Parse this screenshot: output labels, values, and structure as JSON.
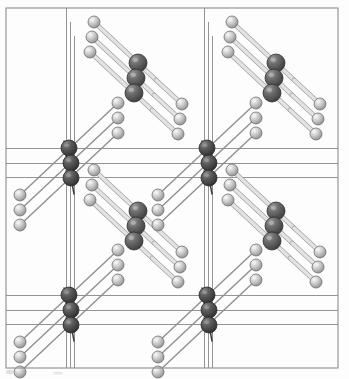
{
  "figure": {
    "kind": "crystal-structure-diagram",
    "title": "",
    "caption": "",
    "background_color": "#fdfdfd",
    "frame": {
      "color": "#8c8c8c",
      "line_width": 1.1,
      "x": 6,
      "y": 8,
      "width": 332,
      "height": 360
    }
  },
  "legend": {
    "atoms": [
      {
        "name": "light-atom",
        "role": "ligand-atom",
        "color": "#c9c9c9",
        "highlight_color": "#f2f2f2",
        "edge_color": "#6f6f6f",
        "radius": 6.0
      },
      {
        "name": "dark-atom",
        "role": "metal-atom",
        "color": "#5f5f5f",
        "highlight_color": "#b5b5b5",
        "edge_color": "#303030",
        "radius": 9.0
      },
      {
        "name": "corner-atom",
        "role": "corner-metal-atom",
        "color": "#565656",
        "highlight_color": "#9a9a9a",
        "edge_color": "#2a2a2a",
        "radius": 8.0
      }
    ],
    "bonds": {
      "name": "bond-rod",
      "fill_color": "#e3e3e3",
      "edge_color": "#9a9a9a",
      "width": 3.4
    },
    "lattice": {
      "name": "lattice-line",
      "color": "#888888",
      "line_width": 0.9
    }
  },
  "lattice_lines": {
    "vertical_groups": [
      {
        "name": "vertical-lattice-group-left",
        "x_values": [
          66.5,
          70.5,
          74.5
        ],
        "y1": 8,
        "y2": 368,
        "short_offsets": [
          0,
          14,
          28
        ]
      },
      {
        "name": "vertical-lattice-group-right",
        "x_values": [
          204.5,
          208.5,
          212.5
        ],
        "y1": 8,
        "y2": 368,
        "short_offsets": [
          0,
          14,
          28
        ]
      }
    ],
    "horizontal_groups": [
      {
        "name": "horizontal-lattice-group-upper",
        "y_values": [
          148.5,
          163.5,
          177.5
        ],
        "x1": 6,
        "x2": 338
      },
      {
        "name": "horizontal-lattice-group-lower",
        "y_values": [
          295.5,
          310.5,
          324.5
        ],
        "x1": 6,
        "x2": 338
      }
    ]
  },
  "chains": [
    {
      "name": "chain-cluster-top-left",
      "origin": [
        94,
        22
      ],
      "offsets": [
        [
          0,
          0
        ],
        [
          -2,
          15
        ],
        [
          -4,
          30
        ]
      ],
      "light_head": [
        0,
        0
      ],
      "dark_mid": [
        44,
        41
      ],
      "light_tail": [
        88,
        82
      ],
      "dark_extra": [
        62,
        58
      ]
    },
    {
      "name": "chain-cluster-top-right",
      "origin": [
        232,
        22
      ],
      "offsets": [
        [
          0,
          0
        ],
        [
          -2,
          15
        ],
        [
          -4,
          30
        ]
      ],
      "light_head": [
        0,
        0
      ],
      "dark_mid": [
        44,
        41
      ],
      "light_tail": [
        88,
        82
      ],
      "dark_extra": [
        62,
        58
      ]
    },
    {
      "name": "chain-cluster-mid-left",
      "origin": [
        94,
        170
      ],
      "offsets": [
        [
          0,
          0
        ],
        [
          -2,
          15
        ],
        [
          -4,
          30
        ]
      ],
      "light_head": [
        0,
        0
      ],
      "dark_mid": [
        44,
        41
      ],
      "light_tail": [
        88,
        82
      ],
      "dark_extra": [
        62,
        58
      ]
    },
    {
      "name": "chain-cluster-mid-right",
      "origin": [
        232,
        170
      ],
      "offsets": [
        [
          0,
          0
        ],
        [
          -2,
          15
        ],
        [
          -4,
          30
        ]
      ],
      "light_head": [
        0,
        0
      ],
      "dark_mid": [
        44,
        41
      ],
      "light_tail": [
        88,
        82
      ],
      "dark_extra": [
        62,
        58
      ]
    }
  ],
  "corner_clusters": [
    {
      "name": "corner-cluster-upper-left",
      "x": 70,
      "y": 163
    },
    {
      "name": "corner-cluster-upper-right",
      "x": 208,
      "y": 163
    },
    {
      "name": "corner-cluster-lower-left",
      "x": 70,
      "y": 310
    },
    {
      "name": "corner-cluster-lower-right",
      "x": 208,
      "y": 310
    }
  ],
  "ascending_chains": [
    {
      "name": "ascending-chain-left-upper",
      "anchor": [
        70,
        163
      ]
    },
    {
      "name": "ascending-chain-right-upper",
      "anchor": [
        208,
        163
      ]
    },
    {
      "name": "ascending-chain-left-lower",
      "anchor": [
        70,
        310
      ]
    },
    {
      "name": "ascending-chain-right-lower",
      "anchor": [
        208,
        310
      ]
    }
  ],
  "artifact": {
    "name": "scan-artifact-speck",
    "x": 10,
    "y": 372,
    "color": "#d8d8d8"
  }
}
